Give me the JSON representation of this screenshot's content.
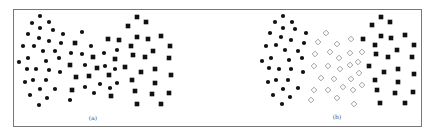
{
  "chart_data": [
    {
      "type": "scatter",
      "panel_label": "(a)",
      "title": "",
      "xlabel": "",
      "ylabel": "",
      "axes_visible": false,
      "grid": false,
      "legend": null,
      "series": [
        {
          "name": "class-1",
          "marker": "circle",
          "color": "#111111",
          "points": [
            [
              40,
              16
            ],
            [
              32,
              23
            ],
            [
              49,
              22
            ],
            [
              40,
              28
            ],
            [
              53,
              30
            ],
            [
              28,
              34
            ],
            [
              39,
              38
            ],
            [
              63,
              34
            ],
            [
              82,
              32
            ],
            [
              49,
              41
            ],
            [
              23,
              46
            ],
            [
              34,
              46
            ],
            [
              61,
              43
            ],
            [
              43,
              51
            ],
            [
              55,
              51
            ],
            [
              91,
              46
            ],
            [
              71,
              53
            ],
            [
              82,
              54
            ],
            [
              104,
              53
            ],
            [
              28,
              58
            ],
            [
              59,
              58
            ],
            [
              19,
              62
            ],
            [
              46,
              61
            ],
            [
              85,
              65
            ],
            [
              27,
              69
            ],
            [
              36,
              69
            ],
            [
              49,
              70
            ],
            [
              60,
              72
            ],
            [
              105,
              66
            ],
            [
              115,
              69
            ],
            [
              117,
              50
            ],
            [
              25,
              82
            ],
            [
              33,
              80
            ],
            [
              46,
              80
            ],
            [
              100,
              84
            ],
            [
              117,
              83
            ],
            [
              40,
              89
            ],
            [
              55,
              89
            ],
            [
              85,
              87
            ],
            [
              110,
              88
            ],
            [
              30,
              95
            ],
            [
              47,
              98
            ],
            [
              94,
              93
            ],
            [
              70,
              100
            ],
            [
              39,
              105
            ]
          ]
        },
        {
          "name": "class-2",
          "marker": "square",
          "color": "#111111",
          "points": [
            [
              75,
              43
            ],
            [
              108,
              39
            ],
            [
              119,
              40
            ],
            [
              137,
              17
            ],
            [
              128,
              26
            ],
            [
              146,
              22
            ],
            [
              137,
              37
            ],
            [
              148,
              39
            ],
            [
              161,
              36
            ],
            [
              93,
              57
            ],
            [
              131,
              46
            ],
            [
              170,
              46
            ],
            [
              133,
              55
            ],
            [
              153,
              51
            ],
            [
              145,
              57
            ],
            [
              115,
              59
            ],
            [
              169,
              58
            ],
            [
              70,
              65
            ],
            [
              97,
              68
            ],
            [
              125,
              67
            ],
            [
              109,
              75
            ],
            [
              141,
              72
            ],
            [
              155,
              69
            ],
            [
              171,
              75
            ],
            [
              76,
              77
            ],
            [
              89,
              76
            ],
            [
              132,
              80
            ],
            [
              155,
              83
            ],
            [
              72,
              90
            ],
            [
              135,
              91
            ],
            [
              152,
              94
            ],
            [
              169,
              93
            ],
            [
              111,
              96
            ],
            [
              137,
              104
            ],
            [
              161,
              104
            ]
          ]
        }
      ],
      "label_pos": [
        93,
        118
      ]
    },
    {
      "type": "scatter",
      "panel_label": "(b)",
      "title": "",
      "xlabel": "",
      "ylabel": "",
      "axes_visible": false,
      "grid": false,
      "legend": null,
      "series": [
        {
          "name": "class-1",
          "marker": "circle",
          "color": "#111111",
          "points": [
            [
              283,
              16
            ],
            [
              275,
              22
            ],
            [
              292,
              22
            ],
            [
              283,
              28
            ],
            [
              295,
              29
            ],
            [
              270,
              33
            ],
            [
              281,
              37
            ],
            [
              306,
              33
            ],
            [
              291,
              40
            ],
            [
              266,
              46
            ],
            [
              276,
              45
            ],
            [
              304,
              43
            ],
            [
              285,
              50
            ],
            [
              298,
              51
            ],
            [
              271,
              58
            ],
            [
              302,
              58
            ],
            [
              262,
              61
            ],
            [
              289,
              60
            ],
            [
              269,
              68
            ],
            [
              279,
              69
            ],
            [
              291,
              69
            ],
            [
              303,
              72
            ],
            [
              268,
              82
            ],
            [
              276,
              80
            ],
            [
              288,
              80
            ],
            [
              283,
              89
            ],
            [
              298,
              88
            ],
            [
              273,
              95
            ],
            [
              290,
              97
            ],
            [
              282,
              104
            ]
          ]
        },
        {
          "name": "unlabeled",
          "marker": "diamond-open",
          "color": "#888888",
          "points": [
            [
              326,
              33
            ],
            [
              318,
              42
            ],
            [
              337,
              44
            ],
            [
              351,
              39
            ],
            [
              315,
              54
            ],
            [
              330,
              52
            ],
            [
              339,
              58
            ],
            [
              350,
              53
            ],
            [
              362,
              52
            ],
            [
              314,
              66
            ],
            [
              328,
              66
            ],
            [
              340,
              69
            ],
            [
              350,
              65
            ],
            [
              358,
              62
            ],
            [
              321,
              78
            ],
            [
              334,
              79
            ],
            [
              351,
              79
            ],
            [
              359,
              73
            ],
            [
              343,
              87
            ],
            [
              353,
              90
            ],
            [
              362,
              85
            ],
            [
              314,
              90
            ],
            [
              328,
              90
            ],
            [
              337,
              98
            ],
            [
              311,
              100
            ],
            [
              354,
              104
            ]
          ]
        },
        {
          "name": "class-2",
          "marker": "square",
          "color": "#111111",
          "points": [
            [
              381,
              17
            ],
            [
              372,
              25
            ],
            [
              390,
              22
            ],
            [
              363,
              39
            ],
            [
              381,
              36
            ],
            [
              391,
              38
            ],
            [
              405,
              35
            ],
            [
              375,
              45
            ],
            [
              414,
              45
            ],
            [
              397,
              50
            ],
            [
              376,
              54
            ],
            [
              388,
              57
            ],
            [
              412,
              57
            ],
            [
              369,
              66
            ],
            [
              398,
              69
            ],
            [
              384,
              72
            ],
            [
              414,
              74
            ],
            [
              375,
              80
            ],
            [
              398,
              82
            ],
            [
              377,
              90
            ],
            [
              395,
              93
            ],
            [
              413,
              92
            ],
            [
              380,
              103
            ],
            [
              405,
              103
            ]
          ]
        }
      ],
      "label_pos": [
        337,
        117
      ]
    }
  ],
  "figure": {
    "frame": {
      "x": 13,
      "y": 9,
      "width": 408,
      "height": 117,
      "color": "#777777"
    },
    "captions": {
      "a": "(a)",
      "b": "(b)"
    }
  }
}
